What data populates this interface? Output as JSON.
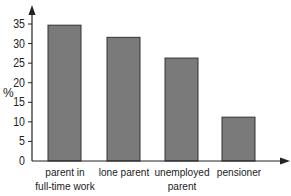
{
  "chart_data": {
    "type": "bar",
    "title": "",
    "xlabel": "",
    "ylabel": "%",
    "categories": [
      "parent in full-time work",
      "lone parent",
      "unemployed parent",
      "pensioner"
    ],
    "category_lines": [
      [
        "parent in",
        "full-time work"
      ],
      [
        "lone parent"
      ],
      [
        "unemployed",
        "parent"
      ],
      [
        "pensioner"
      ]
    ],
    "values": [
      34.7,
      31.6,
      26.3,
      11.2
    ],
    "ylim": [
      0,
      35
    ],
    "yticks": [
      0,
      5,
      10,
      15,
      20,
      25,
      30,
      35
    ],
    "grid": false,
    "legend": null,
    "bar_color": "#7a7a7a",
    "bar_edge_color": "#333333",
    "axis_color": "#222222"
  }
}
